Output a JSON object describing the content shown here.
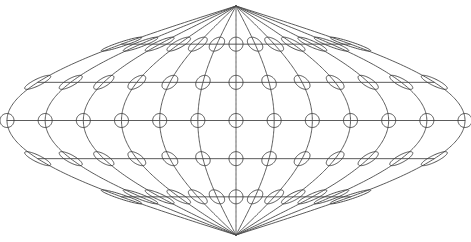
{
  "map": {
    "projection": "sinusoidal",
    "description": "World graticule with Tissot indicatrices",
    "colors": {
      "background": "#ffffff",
      "graticule": "#4a4a4a",
      "boundary": "#4a4a4a",
      "indicatrix": "#3c3c3c"
    },
    "graticule": {
      "meridians_deg": [
        -180,
        -150,
        -120,
        -90,
        -60,
        -30,
        0,
        30,
        60,
        90,
        120,
        150,
        180
      ],
      "parallels_deg": [
        -60,
        -30,
        0,
        30,
        60
      ],
      "latitude_range_deg": [
        -90,
        90
      ],
      "longitude_range_deg": [
        -180,
        180
      ]
    },
    "tissot": {
      "longitudes_deg": [
        -180,
        -150,
        -120,
        -90,
        -60,
        -30,
        0,
        30,
        60,
        90,
        120,
        150,
        180
      ],
      "latitudes_deg": [
        -60,
        -30,
        0,
        30,
        60
      ],
      "radius_deg": 5.5
    }
  }
}
